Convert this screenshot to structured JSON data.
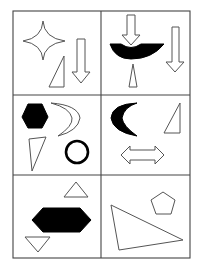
{
  "figure": {
    "type": "shape-pattern-puzzle",
    "layout": {
      "rows": 3,
      "columns": 2
    },
    "colors": {
      "outline": "#555555",
      "fill_solid": "#000000",
      "background": "#ffffff",
      "grid": "#444444"
    },
    "cells": [
      {
        "row": 1,
        "col": 1,
        "shapes": [
          "four-pointed-star (outline)",
          "right-triangle (outline)",
          "down-arrow (outline)"
        ]
      },
      {
        "row": 1,
        "col": 2,
        "shapes": [
          "down-arrow (outline)",
          "arc-crescent (solid)",
          "isosceles-triangle (outline)",
          "down-arrow (outline)"
        ]
      },
      {
        "row": 2,
        "col": 1,
        "shapes": [
          "hexagon (solid)",
          "crescent (outline)",
          "triangle (outline)",
          "circle-ring (solid stroke)"
        ]
      },
      {
        "row": 2,
        "col": 2,
        "shapes": [
          "crescent (solid)",
          "right-triangle (outline)",
          "double-headed-arrow (outline)"
        ]
      },
      {
        "row": 3,
        "col": 1,
        "shapes": [
          "triangle (outline)",
          "elongated-hexagon (solid)",
          "inverted-triangle (outline)"
        ]
      },
      {
        "row": 3,
        "col": 2,
        "shapes": [
          "pentagon (outline)",
          "scalene-triangle (outline)"
        ]
      }
    ]
  }
}
